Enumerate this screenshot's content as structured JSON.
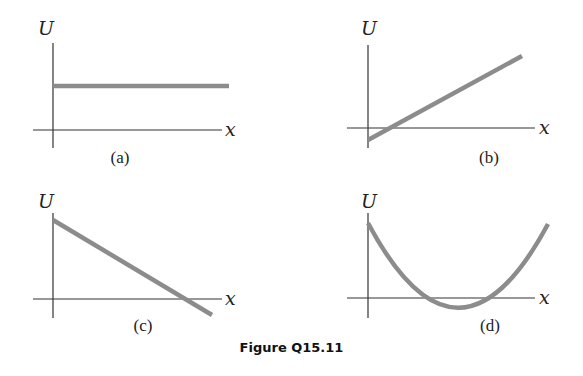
{
  "caption": "Figure Q15.11",
  "panels": [
    {
      "id": "a",
      "label": "(a)",
      "y_axis_label": "U",
      "x_axis_label": "x",
      "shape": "horizontal line above x-axis (constant positive U)"
    },
    {
      "id": "b",
      "label": "(b)",
      "y_axis_label": "U",
      "x_axis_label": "x",
      "shape": "line with positive slope starting slightly below x-axis"
    },
    {
      "id": "c",
      "label": "(c)",
      "y_axis_label": "U",
      "x_axis_label": "x",
      "shape": "line with negative slope crossing x-axis near right end"
    },
    {
      "id": "d",
      "label": "(d)",
      "y_axis_label": "U",
      "x_axis_label": "x",
      "shape": "parabola-like curve with minimum slightly below x-axis"
    }
  ],
  "colors": {
    "curve": "#8c8c8c",
    "axis": "#333333"
  }
}
